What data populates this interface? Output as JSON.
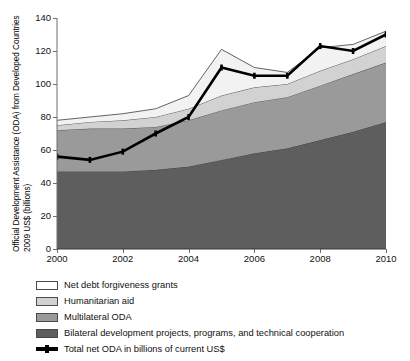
{
  "axes": {
    "ylabel_line1": "Official Development Assistance (ODA) from Developed Countries",
    "ylabel_line2": "2009 US$ (billions)"
  },
  "legend": {
    "items": [
      {
        "label": "Net debt forgiveness grants",
        "swatch": "swatch-white",
        "color": "#ffffff"
      },
      {
        "label": "Humanitarian aid",
        "swatch": "swatch-light-gray",
        "color": "#d2d2d2"
      },
      {
        "label": "Multilateral ODA",
        "swatch": "swatch-medium-gray",
        "color": "#9a9a9a"
      },
      {
        "label": "Bilateral development projects, programs, and technical cooperation",
        "swatch": "swatch-dark-gray",
        "color": "#5e5e5e"
      },
      {
        "label": "Total net ODA in billions of current US$",
        "swatch": "swatch-black-line",
        "color": "#000000"
      }
    ]
  },
  "chart_data": {
    "type": "area",
    "title": "",
    "xlabel": "",
    "ylabel": "Official Development Assistance (ODA) from Developed Countries 2009 US$ (billions)",
    "x": [
      2000,
      2001,
      2002,
      2003,
      2004,
      2005,
      2006,
      2007,
      2008,
      2009,
      2010
    ],
    "xtick_labels": [
      "2000",
      "2002",
      "2004",
      "2006",
      "2008",
      "2010"
    ],
    "xticks": [
      2000,
      2002,
      2004,
      2006,
      2008,
      2010
    ],
    "xlim": [
      2000,
      2010
    ],
    "ylim": [
      0,
      140
    ],
    "yticks": [
      0,
      20,
      40,
      60,
      80,
      100,
      120,
      140
    ],
    "ytick_labels": [
      "0",
      "20",
      "40",
      "60",
      "80",
      "100",
      "120",
      "140"
    ],
    "grid": false,
    "legend_position": "below",
    "stacked": true,
    "series": [
      {
        "name": "Bilateral development projects, programs, and technical cooperation",
        "color": "#5e5e5e",
        "values": [
          47,
          47,
          47,
          48,
          50,
          54,
          58,
          61,
          66,
          71,
          77
        ]
      },
      {
        "name": "Multilateral ODA",
        "color": "#9a9a9a",
        "values": [
          25,
          26,
          26,
          26,
          28,
          30,
          31,
          31,
          33,
          35,
          36
        ]
      },
      {
        "name": "Humanitarian aid",
        "color": "#d2d2d2",
        "values": [
          3,
          4,
          5,
          6,
          7,
          9,
          9,
          8,
          9,
          9,
          10
        ]
      },
      {
        "name": "Net debt forgiveness grants",
        "color": "#f2f2f2",
        "values": [
          3,
          3,
          4,
          5,
          8,
          28,
          12,
          7,
          14,
          9,
          9
        ]
      }
    ],
    "overlay_line": {
      "name": "Total net ODA in billions of current US$",
      "color": "#000000",
      "values": [
        56,
        54,
        59,
        70,
        80,
        110,
        105,
        105,
        123,
        120,
        130
      ]
    },
    "stack_totals": [
      78,
      80,
      82,
      85,
      93,
      121,
      110,
      107,
      122,
      124,
      132
    ]
  }
}
